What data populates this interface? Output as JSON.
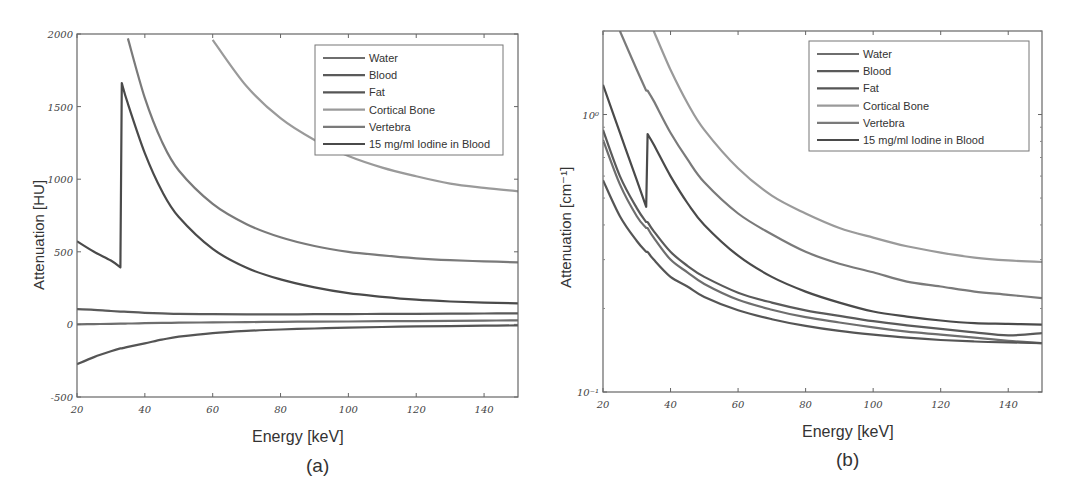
{
  "chart_data": [
    {
      "type": "line",
      "panel_caption": "(a)",
      "xlabel": "Energy [keV]",
      "ylabel": "Attenuation [HU]",
      "xlim": [
        20,
        150
      ],
      "ylim": [
        -500,
        2000
      ],
      "yscale": "linear",
      "xticks": [
        20,
        40,
        60,
        80,
        100,
        120,
        140
      ],
      "yticks": [
        -500,
        0,
        500,
        1000,
        1500,
        2000
      ],
      "ytick_labels": [
        "-500",
        "0",
        "500",
        "1000",
        "1500",
        "2000"
      ],
      "grid": false,
      "legend_position": "upper right",
      "x": [
        20,
        25,
        30,
        32.8,
        33.2,
        35,
        40,
        45,
        50,
        60,
        70,
        80,
        90,
        100,
        110,
        120,
        130,
        140,
        150
      ],
      "series": [
        {
          "name": "Water",
          "color": "#6e6e6e",
          "values": [
            0,
            2,
            4,
            5,
            5,
            6,
            8,
            10,
            12,
            14,
            16,
            18,
            19,
            20,
            22,
            23,
            24,
            26,
            28
          ]
        },
        {
          "name": "Blood",
          "color": "#5a5a5a",
          "values": [
            105,
            100,
            92,
            88,
            88,
            86,
            80,
            76,
            73,
            70,
            69,
            69,
            70,
            71,
            72,
            73,
            74,
            75,
            76
          ]
        },
        {
          "name": "Fat",
          "color": "#555555",
          "values": [
            -275,
            -225,
            -185,
            -165,
            -165,
            -155,
            -130,
            -105,
            -85,
            -60,
            -45,
            -35,
            -28,
            -22,
            -18,
            -14,
            -12,
            -9,
            -7
          ]
        },
        {
          "name": "Cortical Bone",
          "color": "#9a9a9a",
          "values": [
            null,
            null,
            null,
            null,
            null,
            null,
            null,
            null,
            null,
            1960,
            1640,
            1420,
            1270,
            1160,
            1080,
            1020,
            970,
            940,
            917
          ]
        },
        {
          "name": "Vertebra",
          "color": "#7a7a7a",
          "values": [
            null,
            null,
            null,
            null,
            null,
            1970,
            1560,
            1260,
            1060,
            830,
            690,
            600,
            540,
            500,
            475,
            455,
            442,
            434,
            428
          ]
        },
        {
          "name": "15 mg/ml Iodine in Blood",
          "color": "#4a4a4a",
          "values": [
            572,
            500,
            440,
            393,
            1662,
            1520,
            1180,
            920,
            740,
            520,
            390,
            310,
            255,
            215,
            190,
            170,
            158,
            150,
            145
          ]
        }
      ]
    },
    {
      "type": "line",
      "panel_caption": "(b)",
      "xlabel": "Energy [keV]",
      "ylabel": "Attenuation [cm⁻¹]",
      "xlim": [
        20,
        150
      ],
      "ylim": [
        0.1,
        2.0
      ],
      "yscale": "log",
      "xticks": [
        20,
        40,
        60,
        80,
        100,
        120,
        140
      ],
      "yticks": [
        0.1,
        1
      ],
      "ytick_labels": [
        "10⁻¹",
        "10⁰"
      ],
      "grid": false,
      "legend_position": "upper right",
      "x": [
        20,
        25,
        30,
        32.8,
        33.2,
        35,
        40,
        45,
        50,
        60,
        70,
        80,
        90,
        100,
        110,
        120,
        130,
        140,
        150
      ],
      "series": [
        {
          "name": "Water",
          "color": "#6e6e6e",
          "values": [
            0.81,
            0.56,
            0.43,
            0.39,
            0.39,
            0.36,
            0.3,
            0.27,
            0.245,
            0.215,
            0.198,
            0.186,
            0.178,
            0.171,
            0.165,
            0.161,
            0.157,
            0.153,
            0.15
          ]
        },
        {
          "name": "Blood",
          "color": "#5a5a5a",
          "values": [
            0.88,
            0.6,
            0.46,
            0.41,
            0.41,
            0.38,
            0.32,
            0.285,
            0.26,
            0.228,
            0.21,
            0.197,
            0.188,
            0.18,
            0.174,
            0.169,
            0.164,
            0.16,
            0.163
          ]
        },
        {
          "name": "Fat",
          "color": "#555555",
          "values": [
            0.58,
            0.43,
            0.35,
            0.32,
            0.32,
            0.3,
            0.26,
            0.24,
            0.22,
            0.197,
            0.183,
            0.173,
            0.166,
            0.161,
            0.157,
            0.154,
            0.152,
            0.151,
            0.15
          ]
        },
        {
          "name": "Cortical Bone",
          "color": "#9a9a9a",
          "values": [
            null,
            null,
            null,
            null,
            null,
            2.0,
            1.45,
            1.1,
            0.88,
            0.64,
            0.51,
            0.44,
            0.39,
            0.36,
            0.335,
            0.318,
            0.305,
            0.298,
            0.294
          ]
        },
        {
          "name": "Vertebra",
          "color": "#7a7a7a",
          "values": [
            null,
            2.0,
            1.45,
            1.22,
            1.22,
            1.12,
            0.86,
            0.69,
            0.57,
            0.44,
            0.37,
            0.32,
            0.29,
            0.27,
            0.25,
            0.24,
            0.23,
            0.224,
            0.218
          ]
        },
        {
          "name": "15 mg/ml Iodine in Blood",
          "color": "#4a4a4a",
          "values": [
            1.28,
            0.86,
            0.58,
            0.465,
            0.85,
            0.78,
            0.6,
            0.48,
            0.4,
            0.31,
            0.26,
            0.23,
            0.21,
            0.195,
            0.187,
            0.181,
            0.177,
            0.176,
            0.175
          ]
        }
      ]
    }
  ],
  "panels": {
    "a": {
      "caption": "(a)",
      "xlabel": "Energy [keV]",
      "ylabel": "Attenuation [HU]"
    },
    "b": {
      "caption": "(b)",
      "xlabel": "Energy [keV]",
      "ylabel": "Attenuation [cm⁻¹]"
    }
  }
}
